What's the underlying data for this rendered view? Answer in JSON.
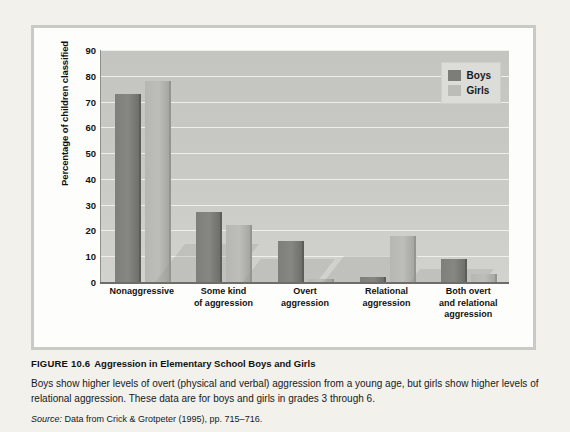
{
  "chart_data": {
    "type": "bar",
    "title": "",
    "xlabel": "",
    "ylabel": "Percentage of children classified",
    "ylim": [
      0,
      90
    ],
    "ytick_step": 10,
    "yticks": [
      90,
      80,
      70,
      60,
      50,
      40,
      30,
      20,
      10,
      0
    ],
    "grid": true,
    "legend_position": "top-right",
    "categories": [
      "Nonaggressive",
      "Some kind of aggression",
      "Overt aggression",
      "Relational aggression",
      "Both overt and relational aggression"
    ],
    "category_label_lines": [
      [
        "Nonaggressive"
      ],
      [
        "Some kind",
        "of aggression"
      ],
      [
        "Overt",
        "aggression"
      ],
      [
        "Relational",
        "aggression"
      ],
      [
        "Both overt",
        "and relational",
        "aggression"
      ]
    ],
    "series": [
      {
        "name": "Boys",
        "color": "#7c7c79",
        "values": [
          73,
          27,
          16,
          2,
          9
        ]
      },
      {
        "name": "Girls",
        "color": "#bcbcb9",
        "values": [
          78,
          22,
          1,
          18,
          3
        ]
      }
    ]
  },
  "legend": {
    "items": [
      {
        "label": "Boys",
        "color": "#7c7c79"
      },
      {
        "label": "Girls",
        "color": "#bcbcb9"
      }
    ]
  },
  "caption": {
    "figure_number": "FIGURE 10.6",
    "figure_title": "Aggression in Elementary School Boys and Girls",
    "body": "Boys show higher levels of overt (physical and verbal) aggression from a young age, but girls show higher levels of relational aggression. These data are for boys and girls in grades 3 through 6.",
    "source_label": "Source:",
    "source_text": "Data from Crick & Grotpeter (1995), pp. 715–716."
  }
}
